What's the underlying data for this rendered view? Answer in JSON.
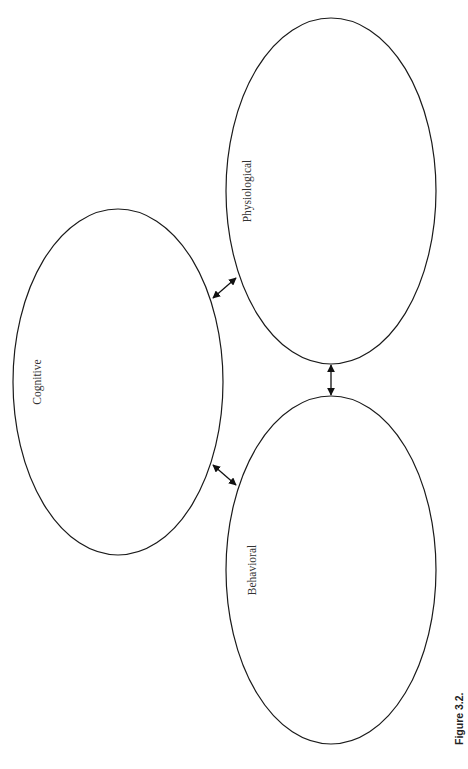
{
  "diagram": {
    "nodes": [
      {
        "id": "physiological",
        "label": "Physiological"
      },
      {
        "id": "cognitive",
        "label": "Cognitive"
      },
      {
        "id": "behavioral",
        "label": "Behavioral"
      }
    ],
    "edges": [
      {
        "from": "cognitive",
        "to": "physiological",
        "type": "bidirectional"
      },
      {
        "from": "cognitive",
        "to": "behavioral",
        "type": "bidirectional"
      },
      {
        "from": "physiological",
        "to": "behavioral",
        "type": "bidirectional"
      }
    ],
    "caption": "Figure 3.2.",
    "colors": {
      "stroke": "#1a1a1a",
      "background": "#ffffff"
    }
  }
}
